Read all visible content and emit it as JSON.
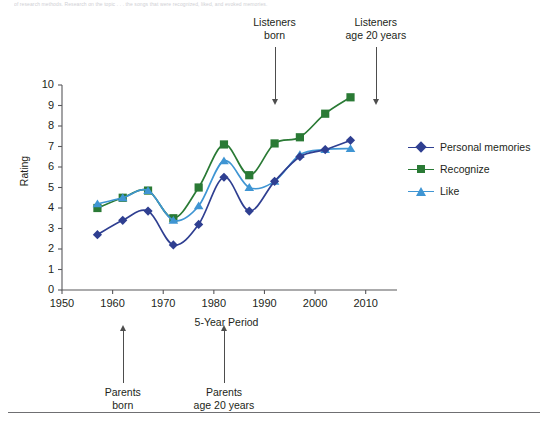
{
  "caption_strip": "of research methods. Research on the topic . . . the songs that were recognized, liked, and evoked memories.",
  "axes": {
    "y_label": "Rating",
    "x_label": "5-Year Period",
    "y_ticks": [
      0,
      1,
      2,
      3,
      4,
      5,
      6,
      7,
      8,
      9,
      10
    ],
    "x_ticks": [
      1950,
      1960,
      1970,
      1980,
      1990,
      2000,
      2010
    ]
  },
  "legend": {
    "items": [
      {
        "label": "Personal memories",
        "marker": "diamond",
        "color": "#2f3f91"
      },
      {
        "label": "Recognize",
        "marker": "square",
        "color": "#2a7a35"
      },
      {
        "label": "Like",
        "marker": "triangle",
        "color": "#3f95d3"
      }
    ]
  },
  "annotations": {
    "top": [
      {
        "line1": "Listeners",
        "line2": "born",
        "year": 1992
      },
      {
        "line1": "Listeners",
        "line2": "age 20 years",
        "year": 2012
      }
    ],
    "bottom": [
      {
        "line1": "Parents",
        "line2": "born",
        "year": 1962
      },
      {
        "line1": "Parents",
        "line2": "age 20 years",
        "year": 1982
      }
    ]
  },
  "chart_data": {
    "type": "line",
    "title": "",
    "xlabel": "5-Year Period",
    "ylabel": "Rating",
    "xlim": [
      1950,
      2015
    ],
    "ylim": [
      0,
      10
    ],
    "grid": false,
    "legend_position": "right",
    "x": [
      1957,
      1962,
      1967,
      1972,
      1977,
      1982,
      1987,
      1992,
      1997,
      2002,
      2007
    ],
    "series": [
      {
        "name": "Personal memories",
        "color": "#2f3f91",
        "marker": "diamond",
        "values": [
          2.7,
          3.4,
          3.85,
          2.2,
          3.2,
          5.5,
          3.85,
          5.3,
          6.5,
          6.85,
          7.3
        ]
      },
      {
        "name": "Recognize",
        "color": "#2a7a35",
        "marker": "square",
        "values": [
          4.0,
          4.5,
          4.85,
          3.5,
          5.0,
          7.1,
          5.6,
          7.15,
          7.45,
          8.6,
          9.4
        ]
      },
      {
        "name": "Like",
        "color": "#3f95d3",
        "marker": "triangle",
        "values": [
          4.2,
          4.5,
          4.85,
          3.4,
          4.1,
          6.3,
          5.0,
          5.3,
          6.6,
          6.85,
          6.9
        ]
      }
    ]
  }
}
